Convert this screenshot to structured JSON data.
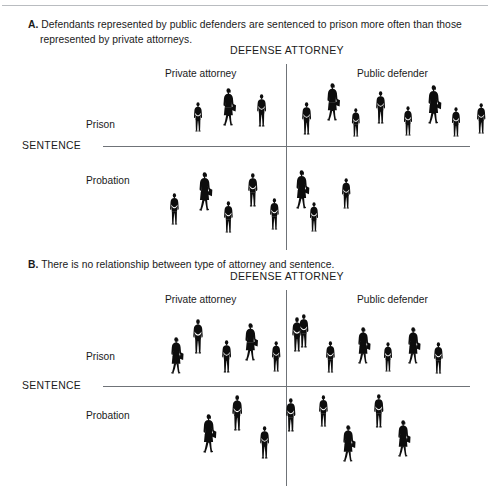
{
  "figure": {
    "panels": [
      {
        "id": "a",
        "letter": "A.",
        "caption_line1": "Defendants represented by public defenders are sentenced to prison more often than those",
        "caption_line2": "represented by private attorneys.",
        "column_axis_title": "DEFENSE ATTORNEY",
        "row_axis_title": "SENTENCE",
        "column_labels": [
          "Private attorney",
          "Public defender"
        ],
        "row_labels": [
          "Prison",
          "Probation"
        ],
        "counts": {
          "prison_private": 3,
          "prison_public": 8,
          "probation_private": 7,
          "probation_public": 1
        }
      },
      {
        "id": "b",
        "letter": "B.",
        "caption_line1": "There is no relationship between type of attorney and sentence.",
        "caption_line2": "",
        "column_axis_title": "DEFENSE ATTORNEY",
        "row_axis_title": "SENTENCE",
        "column_labels": [
          "Private attorney",
          "Public defender"
        ],
        "row_labels": [
          "Prison",
          "Probation"
        ],
        "counts": {
          "prison_private": 6,
          "prison_public": 6,
          "probation_private": 4,
          "probation_public": 4
        }
      }
    ]
  },
  "chart_data": {
    "type": "table",
    "xlabel": "DEFENSE ATTORNEY",
    "ylabel": "SENTENCE",
    "categories": [
      "Private attorney",
      "Public defender"
    ],
    "rows": [
      "Prison",
      "Probation"
    ],
    "units": "person icons (1 icon = 1 defendant)",
    "panels": [
      {
        "panel": "A",
        "caption": "Defendants represented by public defenders are sentenced to prison more often than those represented by private attorneys.",
        "series": [
          {
            "name": "Prison",
            "values": [
              3,
              8
            ]
          },
          {
            "name": "Probation",
            "values": [
              7,
              1
            ]
          }
        ]
      },
      {
        "panel": "B",
        "caption": "There is no relationship between type of attorney and sentence.",
        "series": [
          {
            "name": "Prison",
            "values": [
              6,
              6
            ]
          },
          {
            "name": "Probation",
            "values": [
              4,
              4
            ]
          }
        ]
      }
    ],
    "grid": false,
    "legend": "none"
  },
  "figures_layout": {
    "a_prison_private": [
      {
        "x": 32,
        "y": 22,
        "t": "m",
        "s": 30
      },
      {
        "x": 60,
        "y": 8,
        "t": "w",
        "s": 38
      },
      {
        "x": 95,
        "y": 14,
        "t": "m",
        "s": 33
      }
    ],
    "a_prison_public": [
      {
        "x": 8,
        "y": 22,
        "t": "m",
        "s": 33
      },
      {
        "x": 32,
        "y": 3,
        "t": "w",
        "s": 38
      },
      {
        "x": 58,
        "y": 28,
        "t": "m",
        "s": 29
      },
      {
        "x": 82,
        "y": 11,
        "t": "m",
        "s": 33
      },
      {
        "x": 110,
        "y": 26,
        "t": "m",
        "s": 30
      },
      {
        "x": 133,
        "y": 5,
        "t": "w",
        "s": 39
      },
      {
        "x": 158,
        "y": 27,
        "t": "m",
        "s": 30
      },
      {
        "x": 183,
        "y": 23,
        "t": "m",
        "s": 31
      }
    ],
    "a_probation_private": [
      {
        "x": 8,
        "y": 27,
        "t": "m",
        "s": 32
      },
      {
        "x": 36,
        "y": 6,
        "t": "w",
        "s": 39
      },
      {
        "x": 62,
        "y": 35,
        "t": "m",
        "s": 32
      },
      {
        "x": 86,
        "y": 7,
        "t": "m",
        "s": 34
      },
      {
        "x": 108,
        "y": 32,
        "t": "m",
        "s": 32
      },
      {
        "x": 133,
        "y": 4,
        "t": "w",
        "s": 39
      },
      {
        "x": 148,
        "y": 36,
        "t": "m",
        "s": 30
      }
    ],
    "a_probation_public": [
      {
        "x": 48,
        "y": 12,
        "t": "m",
        "s": 31
      }
    ],
    "b_prison_private": [
      {
        "x": 10,
        "y": 23,
        "t": "w",
        "s": 37
      },
      {
        "x": 33,
        "y": 5,
        "t": "m",
        "s": 35
      },
      {
        "x": 62,
        "y": 26,
        "t": "m",
        "s": 33
      },
      {
        "x": 84,
        "y": 9,
        "t": "w",
        "s": 38
      },
      {
        "x": 112,
        "y": 27,
        "t": "m",
        "s": 31
      },
      {
        "x": 132,
        "y": 3,
        "t": "m",
        "s": 35
      }
    ],
    "b_prison_public": [
      {
        "x": 5,
        "y": 0,
        "t": "m",
        "s": 34
      },
      {
        "x": 32,
        "y": 27,
        "t": "m",
        "s": 32
      },
      {
        "x": 63,
        "y": 13,
        "t": "w",
        "s": 37
      },
      {
        "x": 90,
        "y": 28,
        "t": "m",
        "s": 30
      },
      {
        "x": 113,
        "y": 13,
        "t": "w",
        "s": 37
      },
      {
        "x": 140,
        "y": 28,
        "t": "m",
        "s": 32
      }
    ],
    "b_probation_private": [
      {
        "x": 42,
        "y": 22,
        "t": "w",
        "s": 39
      },
      {
        "x": 72,
        "y": 3,
        "t": "m",
        "s": 36
      },
      {
        "x": 100,
        "y": 34,
        "t": "m",
        "s": 33
      },
      {
        "x": 126,
        "y": 6,
        "t": "m",
        "s": 34
      }
    ],
    "b_probation_public": [
      {
        "x": 25,
        "y": 3,
        "t": "m",
        "s": 32
      },
      {
        "x": 48,
        "y": 33,
        "t": "w",
        "s": 37
      },
      {
        "x": 80,
        "y": 2,
        "t": "m",
        "s": 34
      },
      {
        "x": 103,
        "y": 28,
        "t": "w",
        "s": 37
      }
    ]
  }
}
